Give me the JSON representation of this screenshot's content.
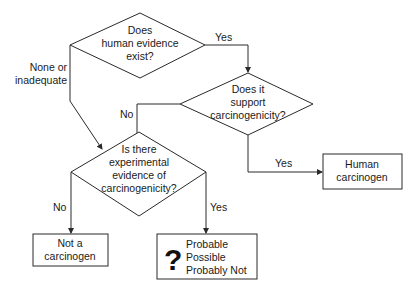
{
  "diagram": {
    "type": "flowchart",
    "nodes": {
      "q_human": {
        "kind": "decision",
        "lines": [
          "Does",
          "human evidence",
          "exist?"
        ]
      },
      "q_support": {
        "kind": "decision",
        "lines": [
          "Does it",
          "support",
          "carcinogenicity?"
        ]
      },
      "q_experimental": {
        "kind": "decision",
        "lines": [
          "Is there",
          "experimental",
          "evidence of",
          "carcinogenicity?"
        ]
      },
      "r_human": {
        "kind": "result",
        "lines": [
          "Human",
          "carcinogen"
        ]
      },
      "r_not": {
        "kind": "result",
        "lines": [
          "Not a",
          "carcinogen"
        ]
      },
      "r_uncertain": {
        "kind": "result",
        "icon": "question-mark-icon",
        "symbol": "?",
        "lines": [
          "Probable",
          "Possible",
          "Probably Not"
        ]
      }
    },
    "edges": {
      "human_yes": {
        "from": "q_human",
        "to": "q_support",
        "label": "Yes"
      },
      "human_none": {
        "from": "q_human",
        "to": "q_experimental",
        "label_lines": [
          "None or",
          "inadequate"
        ]
      },
      "support_no": {
        "from": "q_support",
        "to": "q_experimental",
        "label": "No"
      },
      "support_yes": {
        "from": "q_support",
        "to": "r_human",
        "label": "Yes"
      },
      "exp_no": {
        "from": "q_experimental",
        "to": "r_not",
        "label": "No"
      },
      "exp_yes": {
        "from": "q_experimental",
        "to": "r_uncertain",
        "label": "Yes"
      }
    }
  }
}
